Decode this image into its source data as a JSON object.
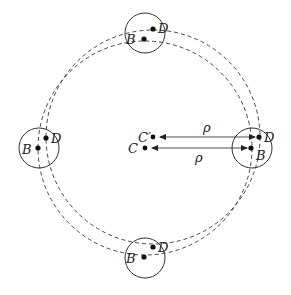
{
  "diagram": {
    "type": "geometric orbit diagram",
    "center_points": [
      {
        "label": "C'",
        "x": 153,
        "y": 137
      },
      {
        "label": "C",
        "x": 145,
        "y": 148
      }
    ],
    "dashed_circles": [
      {
        "center": "C",
        "cx": 145,
        "cy": 148,
        "r": 107
      },
      {
        "center": "C'",
        "cx": 153,
        "cy": 137,
        "r": 107
      }
    ],
    "small_circles": [
      {
        "position": "top",
        "cx": 145,
        "cy": 33,
        "r": 20,
        "B": {
          "label": "B",
          "x": 144,
          "y": 39
        },
        "D": {
          "label": "D",
          "x": 153,
          "y": 29
        }
      },
      {
        "position": "left",
        "cx": 39,
        "cy": 148,
        "r": 20,
        "B": {
          "label": "B",
          "x": 38,
          "y": 148
        },
        "D": {
          "label": "D",
          "x": 46,
          "y": 138
        }
      },
      {
        "position": "right",
        "cx": 252,
        "cy": 148,
        "r": 20,
        "B": {
          "label": "B",
          "x": 251,
          "y": 148
        },
        "D": {
          "label": "D",
          "x": 259,
          "y": 137
        }
      },
      {
        "position": "bottom",
        "cx": 145,
        "cy": 258,
        "r": 20,
        "B": {
          "label": "B",
          "x": 144,
          "y": 257
        },
        "D": {
          "label": "D",
          "x": 153,
          "y": 247
        }
      }
    ],
    "arrows": [
      {
        "from": "C'",
        "to": "D (right)",
        "label": "ρ",
        "label_pos": "above"
      },
      {
        "from": "C",
        "to": "B (right)",
        "label": "ρ",
        "label_pos": "below"
      }
    ],
    "labels": {
      "C": "C",
      "C_prime": "C′",
      "B": "B",
      "D": "D",
      "rho": "ρ"
    }
  }
}
